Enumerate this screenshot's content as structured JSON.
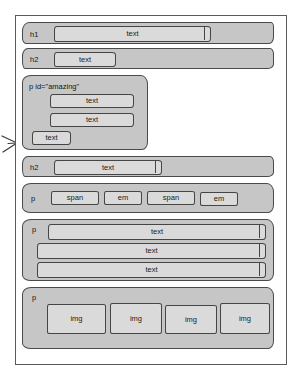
{
  "diagram": {
    "title": "HTML element box structure sketch",
    "colors": {
      "block_fill": "#c6c6c6",
      "inner_fill": "#dadada",
      "stroke": "#454545",
      "frame_stroke": "#5a5a5a",
      "page_background": "#ffffff"
    },
    "annotations": {
      "pointer_arrow": "arrow pointing right at the p id=\"amazing\" block"
    }
  },
  "blocks": [
    {
      "id": "h1-block",
      "tag": "h1",
      "children": [
        {
          "label": "text"
        }
      ]
    },
    {
      "id": "h2-block-1",
      "tag": "h2",
      "children": [
        {
          "label": "text"
        }
      ]
    },
    {
      "id": "p-amazing-block",
      "tag": "p id=\"amazing\"",
      "children": [
        {
          "label": "text"
        },
        {
          "label": "text"
        },
        {
          "label": "text"
        }
      ]
    },
    {
      "id": "h2-block-2",
      "tag": "h2",
      "children": [
        {
          "label": "text"
        }
      ]
    },
    {
      "id": "p-inline-block",
      "tag": "p",
      "children": [
        {
          "label": "span"
        },
        {
          "label": "em"
        },
        {
          "label": "span"
        },
        {
          "label": "em"
        }
      ]
    },
    {
      "id": "p-text-block",
      "tag": "p",
      "children": [
        {
          "label": "text"
        },
        {
          "label": "text"
        },
        {
          "label": "text"
        }
      ]
    },
    {
      "id": "p-img-block",
      "tag": "p",
      "children": [
        {
          "label": "img"
        },
        {
          "label": "img"
        },
        {
          "label": "img"
        },
        {
          "label": "img"
        }
      ]
    }
  ]
}
